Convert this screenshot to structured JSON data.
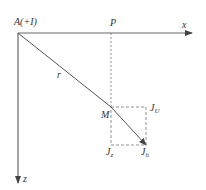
{
  "diagram": {
    "origin_label": "A(+I)",
    "x_axis_label": "x",
    "z_axis_label": "z",
    "point_p_label": "P",
    "point_m_label": "M",
    "radius_label": "r",
    "jh_label": "J",
    "jh_sub": "h",
    "jz_label": "J",
    "jz_sub": "z",
    "ju_label": "J",
    "ju_sub": "U",
    "colors": {
      "line": "#555555",
      "dashed": "#777777",
      "text": "#333333"
    }
  }
}
